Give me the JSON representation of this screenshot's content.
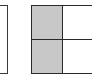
{
  "diagram": {
    "left_box": {
      "fill": "#ffffff",
      "border": "#3a3a3a"
    },
    "grid": {
      "rows": 2,
      "cols": 2,
      "border": "#2a2a2a",
      "cells": [
        {
          "row": 0,
          "col": 0,
          "shaded": true,
          "fill": "#c8c8c8"
        },
        {
          "row": 0,
          "col": 1,
          "shaded": false,
          "fill": "#ffffff"
        },
        {
          "row": 1,
          "col": 0,
          "shaded": true,
          "fill": "#c8c8c8"
        },
        {
          "row": 1,
          "col": 1,
          "shaded": false,
          "fill": "#ffffff"
        }
      ]
    }
  }
}
